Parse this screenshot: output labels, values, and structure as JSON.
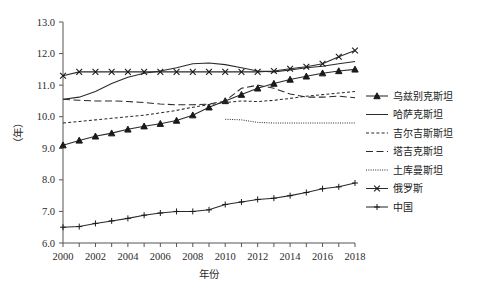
{
  "chart_data": {
    "type": "line",
    "title": "",
    "xlabel": "年份",
    "ylabel": "（年）",
    "xlim": [
      2000,
      2018
    ],
    "ylim": [
      6.0,
      13.0
    ],
    "grid": false,
    "legend_position": "right",
    "x": [
      2000,
      2001,
      2002,
      2003,
      2004,
      2005,
      2006,
      2007,
      2008,
      2009,
      2010,
      2011,
      2012,
      2013,
      2014,
      2015,
      2016,
      2017,
      2018
    ],
    "x_tick_labels": [
      "2000",
      "2002",
      "2004",
      "2006",
      "2008",
      "2010",
      "2012",
      "2014",
      "2016",
      "2018"
    ],
    "x_tick_values": [
      2000,
      2002,
      2004,
      2006,
      2008,
      2010,
      2012,
      2014,
      2016,
      2018
    ],
    "y_tick_labels": [
      "6.0",
      "7.0",
      "8.0",
      "9.0",
      "10.0",
      "11.0",
      "12.0",
      "13.0"
    ],
    "y_tick_values": [
      6.0,
      7.0,
      8.0,
      9.0,
      10.0,
      11.0,
      12.0,
      13.0
    ],
    "series": [
      {
        "name": "乌兹别克斯坦",
        "style": "solid",
        "marker": "triangle",
        "values": [
          9.1,
          9.25,
          9.38,
          9.48,
          9.6,
          9.7,
          9.78,
          9.88,
          10.05,
          10.3,
          10.5,
          10.7,
          10.9,
          11.05,
          11.18,
          11.28,
          11.38,
          11.45,
          11.5
        ]
      },
      {
        "name": "哈萨克斯坦",
        "style": "solid",
        "marker": "none",
        "values": [
          10.55,
          10.62,
          10.8,
          11.05,
          11.25,
          11.38,
          11.45,
          11.55,
          11.68,
          11.7,
          11.65,
          11.55,
          11.45,
          11.42,
          11.48,
          11.55,
          11.6,
          11.68,
          11.75
        ]
      },
      {
        "name": "吉尔吉斯斯坦",
        "style": "short-dash",
        "marker": "none",
        "values": [
          9.8,
          9.85,
          9.9,
          9.95,
          10.0,
          10.05,
          10.12,
          10.2,
          10.3,
          10.38,
          10.45,
          10.5,
          10.48,
          10.52,
          10.58,
          10.65,
          10.7,
          10.75,
          10.8
        ]
      },
      {
        "name": "塔吉克斯坦",
        "style": "long-dash",
        "marker": "none",
        "values": [
          10.55,
          10.52,
          10.5,
          10.5,
          10.48,
          10.45,
          10.4,
          10.38,
          10.38,
          10.4,
          10.5,
          10.9,
          11.0,
          10.9,
          10.72,
          10.62,
          10.62,
          10.65,
          10.6
        ]
      },
      {
        "name": "土库曼斯坦",
        "style": "dotted",
        "marker": "none",
        "values": [
          null,
          null,
          null,
          null,
          null,
          null,
          null,
          null,
          null,
          null,
          9.92,
          9.9,
          9.82,
          9.8,
          9.8,
          9.8,
          9.8,
          9.8,
          9.8
        ]
      },
      {
        "name": "俄罗斯",
        "style": "solid",
        "marker": "x",
        "values": [
          11.3,
          11.42,
          11.42,
          11.42,
          11.42,
          11.42,
          11.42,
          11.42,
          11.42,
          11.42,
          11.42,
          11.42,
          11.42,
          11.45,
          11.52,
          11.58,
          11.68,
          11.9,
          12.1
        ]
      },
      {
        "name": "中国",
        "style": "solid",
        "marker": "plus",
        "values": [
          6.5,
          6.52,
          6.62,
          6.7,
          6.78,
          6.88,
          6.95,
          7.0,
          7.0,
          7.05,
          7.22,
          7.3,
          7.38,
          7.42,
          7.5,
          7.6,
          7.72,
          7.78,
          7.9
        ]
      }
    ]
  },
  "legend": {
    "items": [
      {
        "label": "乌兹别克斯坦"
      },
      {
        "label": "哈萨克斯坦"
      },
      {
        "label": "吉尔吉斯斯坦"
      },
      {
        "label": "塔吉克斯坦"
      },
      {
        "label": "土库曼斯坦"
      },
      {
        "label": "俄罗斯"
      },
      {
        "label": "中国"
      }
    ]
  }
}
